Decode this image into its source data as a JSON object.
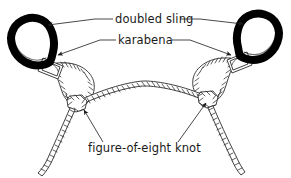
{
  "figure": {
    "background_color": "#ffffff",
    "ink_color": "#1a1a1a",
    "sling_color": "#000000",
    "rope_fill": "#ffffff",
    "rope_outline": "#2b2b2b"
  },
  "labels": {
    "doubled_sling": "doubled sling",
    "karabena": "karabena",
    "figure_of_eight_knot": "figure-of-eight knot"
  },
  "annotations": [
    {
      "id": "doubled-sling",
      "text": "doubled sling",
      "text_x": 118,
      "text_y": 22,
      "arrow_targets": [
        "left-sling-loop",
        "right-sling-loop"
      ]
    },
    {
      "id": "karabena",
      "text": "karabena",
      "text_x": 120,
      "text_y": 43,
      "arrow_targets": [
        "left-karabiner",
        "right-karabiner"
      ]
    },
    {
      "id": "figure-of-eight-knot",
      "text": "figure-of-eight knot",
      "text_x": 90,
      "text_y": 150,
      "arrow_targets": [
        "left-knot",
        "right-knot"
      ]
    }
  ],
  "parts": [
    {
      "name": "left-sling-loop",
      "kind": "doubled-sling",
      "cx": 32,
      "cy": 42
    },
    {
      "name": "right-sling-loop",
      "kind": "doubled-sling",
      "cx": 256,
      "cy": 42
    },
    {
      "name": "left-karabiner",
      "kind": "karabena",
      "cx": 55,
      "cy": 68
    },
    {
      "name": "right-karabiner",
      "kind": "karabena",
      "cx": 237,
      "cy": 62
    },
    {
      "name": "left-knot",
      "kind": "figure-of-eight-knot",
      "cx": 78,
      "cy": 103
    },
    {
      "name": "right-knot",
      "kind": "figure-of-eight-knot",
      "cx": 209,
      "cy": 99
    },
    {
      "name": "central-rope-span",
      "kind": "rope"
    },
    {
      "name": "left-rope-tail",
      "kind": "rope"
    },
    {
      "name": "right-rope-tail",
      "kind": "rope"
    }
  ]
}
